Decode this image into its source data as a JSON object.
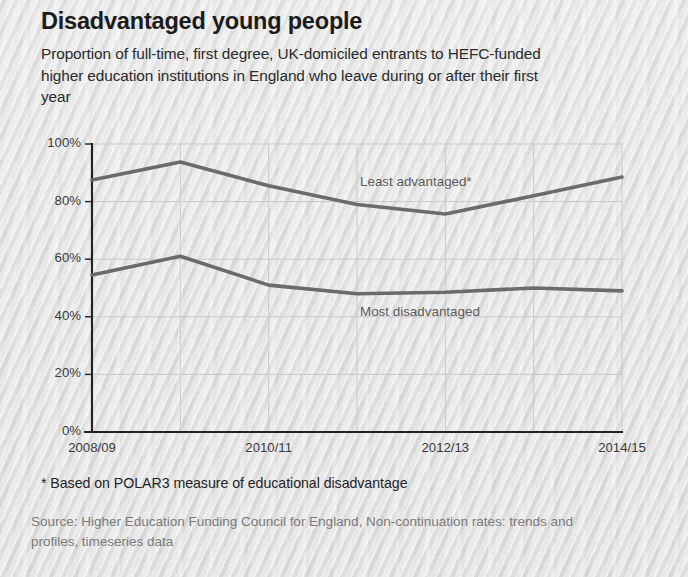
{
  "header": {
    "title": "Disadvantaged young people",
    "subtitle": "Proportion of full-time, first degree, UK-domiciled entrants to HEFC-funded higher education institutions in England who leave during or after their first year"
  },
  "footnote": "* Based on POLAR3 measure of educational disadvantage",
  "source": "Source: Higher Education Funding Council for England, Non-continuation rates: trends and profiles, timeseries data",
  "colors": {
    "background": "#e2e2e2",
    "line": "#6b6b6b",
    "axis": "#222222",
    "grid": "#c9c9c9",
    "title_text": "#1b1b1b",
    "label_text": "#5d5d5d"
  },
  "chart_data": {
    "type": "line",
    "title": "Disadvantaged young people",
    "subtitle": "Proportion of full-time, first degree, UK-domiciled entrants to HEFC-funded higher education institutions in England who leave during or after their first year",
    "xlabel": "",
    "ylabel": "",
    "grid": true,
    "legend_position": "inline-labels",
    "categories": [
      "2008/09",
      "2009/10",
      "2010/11",
      "2011/12",
      "2012/13",
      "2013/14",
      "2014/15"
    ],
    "tick_labels_x": [
      "2008/09",
      "",
      "2010/11",
      "",
      "2012/13",
      "",
      "2014/15"
    ],
    "tick_labels_y": [
      "0%",
      "20%",
      "40%",
      "60%",
      "80%",
      "100%"
    ],
    "ticks_y": [
      0,
      20,
      40,
      60,
      80,
      100
    ],
    "ylim": [
      0,
      100
    ],
    "yunit": "%",
    "series": [
      {
        "name": "Least advantaged*",
        "label": "Least advantaged*",
        "values": [
          87.5,
          93.7,
          85.5,
          79.0,
          75.7,
          82.0,
          88.5
        ]
      },
      {
        "name": "Most disadvantaged",
        "label": "Most disadvantaged",
        "values": [
          54.5,
          61.0,
          51.0,
          48.0,
          48.5,
          50.0,
          49.0
        ]
      }
    ]
  }
}
